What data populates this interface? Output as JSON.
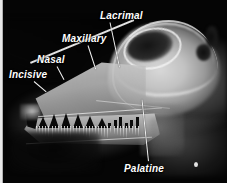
{
  "figure": {
    "type": "radiograph",
    "background_color": "#050505",
    "label_color": "#ffffff",
    "leader_color": "#f2f2f2"
  },
  "labels": [
    {
      "id": "incisive",
      "text": "Incisive"
    },
    {
      "id": "nasal",
      "text": "Nasal"
    },
    {
      "id": "maxillary",
      "text": "Maxillary"
    },
    {
      "id": "lacrimal",
      "text": "Lacrimal"
    },
    {
      "id": "palatine",
      "text": "Palatine"
    }
  ]
}
